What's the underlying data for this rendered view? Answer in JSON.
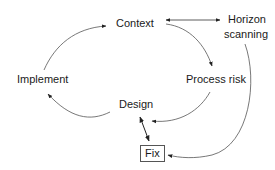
{
  "diagram": {
    "nodes": {
      "context": "Context",
      "horizon_line1": "Horizon",
      "horizon_line2": "scanning",
      "implement": "Implement",
      "process_risk": "Process risk",
      "design": "Design",
      "fix": "Fix"
    },
    "edges": [
      {
        "from": "Implement",
        "to": "Context",
        "type": "arrow"
      },
      {
        "from": "Context",
        "to": "Horizon scanning",
        "type": "bidirectional"
      },
      {
        "from": "Context",
        "to": "Process risk",
        "type": "arrow"
      },
      {
        "from": "Process risk",
        "to": "Design",
        "type": "arrow"
      },
      {
        "from": "Design",
        "to": "Implement",
        "type": "arrow"
      },
      {
        "from": "Design",
        "to": "Fix",
        "type": "bidirectional"
      },
      {
        "from": "Horizon scanning",
        "to": "Fix",
        "type": "arrow"
      }
    ],
    "colors": {
      "line": "#444444",
      "text": "#1a1a1a",
      "background": "#ffffff"
    }
  }
}
